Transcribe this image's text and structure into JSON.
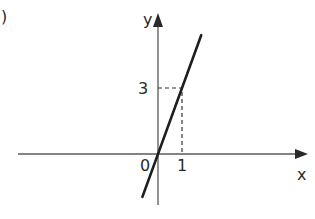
{
  "part_label": ")",
  "chart_data": {
    "type": "line",
    "title": "",
    "xlabel": "x",
    "ylabel": "y",
    "origin_label": "0",
    "x_ticks": [
      {
        "value": 1,
        "label": "1"
      }
    ],
    "y_ticks": [
      {
        "value": 3,
        "label": "3"
      }
    ],
    "series": [
      {
        "name": "y = 3x",
        "x": [
          -0.65,
          0,
          1,
          1.8
        ],
        "y": [
          -1.95,
          0,
          3,
          5.4
        ]
      }
    ],
    "annotations": [
      {
        "type": "dashed-guide",
        "point": [
          1,
          3
        ]
      }
    ],
    "xlim": [
      -5.8,
      6.2
    ],
    "ylim": [
      -2.3,
      6.4
    ],
    "grid": false,
    "colors": {
      "axis": "#5a5a5a",
      "line": "#1e1e1e",
      "text": "#2a2a2a"
    }
  }
}
